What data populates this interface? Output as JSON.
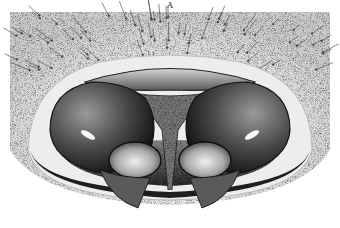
{
  "figure": {
    "label": "A",
    "colors": {
      "background": "#ffffff",
      "integument": "#d9d9d9",
      "dark_shading": "#1a1a1a",
      "mid_shading": "#6e6e6e",
      "highlight": "#f4f4f4"
    }
  }
}
